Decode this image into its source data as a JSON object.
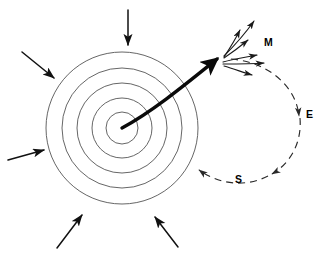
{
  "figure": {
    "background_color": "#ffffff",
    "width": 328,
    "height": 255,
    "ring_color": "#555555",
    "arrow_color": "#111111",
    "jet_color": "#0a0a0a",
    "loop_color": "#2a2a2a"
  },
  "labels": {
    "m": "M",
    "e": "E",
    "s": "S"
  },
  "core": {
    "center_x": 122,
    "center_y": 128,
    "ring_count": 5,
    "ring_radii": [
      16,
      30,
      45,
      60,
      76
    ]
  },
  "inflow_arrows": [
    {
      "name": "top",
      "x1": 128,
      "y1": 10,
      "x2": 128,
      "y2": 45
    },
    {
      "name": "upper-left",
      "x1": 22,
      "y1": 52,
      "x2": 54,
      "y2": 78
    },
    {
      "name": "left",
      "x1": 8,
      "y1": 160,
      "x2": 44,
      "y2": 150
    },
    {
      "name": "bottom-left",
      "x1": 57,
      "y1": 248,
      "x2": 82,
      "y2": 215
    },
    {
      "name": "bottom-right",
      "x1": 178,
      "y1": 247,
      "x2": 155,
      "y2": 217
    }
  ],
  "jet": {
    "name": "relativistic-jet",
    "start_x": 122,
    "start_y": 128,
    "end_x": 219,
    "end_y": 58
  },
  "fan_arrows": [
    {
      "name": "fan-1",
      "x1": 224,
      "y1": 56,
      "x2": 255,
      "y2": 20
    },
    {
      "name": "fan-2",
      "x1": 224,
      "y1": 57,
      "x2": 241,
      "y2": 29
    },
    {
      "name": "fan-3",
      "x1": 224,
      "y1": 58,
      "x2": 249,
      "y2": 40
    },
    {
      "name": "fan-4",
      "x1": 223,
      "y1": 62,
      "x2": 258,
      "y2": 55
    },
    {
      "name": "fan-5",
      "x1": 223,
      "y1": 64,
      "x2": 265,
      "y2": 63
    },
    {
      "name": "fan-6",
      "x1": 224,
      "y1": 66,
      "x2": 253,
      "y2": 75
    }
  ],
  "outflow_loop": {
    "name": "dashed-outflow-loop",
    "description": "dashed circulation loop from jet head around right side and back left along the bottom"
  }
}
